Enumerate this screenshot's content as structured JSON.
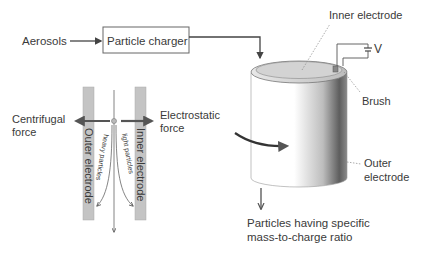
{
  "flow": {
    "input_label": "Aerosols",
    "charger_label": "Particle charger"
  },
  "detail": {
    "centrifugal_line1": "Centrifugal",
    "centrifugal_line2": "force",
    "electrostatic_line1": "Electrostatic",
    "electrostatic_line2": "force",
    "outer_electrode": "Outer electrode",
    "inner_electrode": "Inner electrode",
    "heavy_particles": "heavy particles",
    "light_particles": "light particles"
  },
  "device": {
    "inner_electrode_label": "Inner electrode",
    "voltage_label": "V",
    "brush_label": "Brush",
    "outer_line1": "Outer",
    "outer_line2": "electrode",
    "output_line1": "Particles having specific",
    "output_line2": "mass-to-charge ratio"
  },
  "colors": {
    "electrode_fill": "#c8c8c8",
    "line": "#444444",
    "text": "#3a3a3a"
  }
}
